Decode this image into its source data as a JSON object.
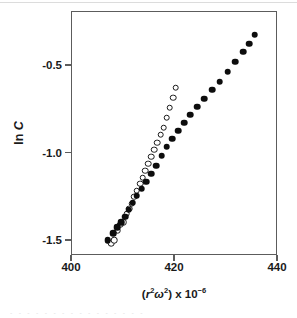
{
  "figure": {
    "caption_ghost": "- - - - - - - - - - - - - - - -"
  },
  "axes": {
    "x_ticks": [
      {
        "value": 400,
        "label": "400"
      },
      {
        "value": 420,
        "label": "420"
      },
      {
        "value": 440,
        "label": "440"
      }
    ],
    "y_ticks": [
      {
        "value": -0.5,
        "label": "-0.5"
      },
      {
        "value": -1.0,
        "label": "-1.0"
      },
      {
        "value": -1.5,
        "label": "-1.5"
      }
    ],
    "x_title_prefix": "(",
    "x_title_r": "r",
    "x_title_r_sup": "2",
    "x_title_omega": "ω",
    "x_title_omega_sup": "2",
    "x_title_mid": ") x 10",
    "x_title_exp": "−6",
    "y_title_ln": "ln ",
    "y_title_c": "C"
  },
  "chart_data": {
    "type": "scatter",
    "title": "",
    "subtitle": "",
    "xlabel": "(r²ω²) x 10⁻⁶",
    "ylabel": "ln C",
    "xlim": [
      400,
      440
    ],
    "ylim": [
      -1.6,
      -0.23
    ],
    "grid": false,
    "legend": null,
    "axis_color": "#5c5c5c",
    "marker_color": "#0d0d0d",
    "series": [
      {
        "name": "open-circles",
        "marker": "open circle",
        "points": [
          [
            407.6,
            -1.514
          ],
          [
            408.2,
            -1.494
          ],
          [
            408.9,
            -1.441
          ],
          [
            409.4,
            -1.408
          ],
          [
            410.0,
            -1.391
          ],
          [
            410.6,
            -1.345
          ],
          [
            411.1,
            -1.316
          ],
          [
            411.6,
            -1.287
          ],
          [
            412.1,
            -1.247
          ],
          [
            412.6,
            -1.213
          ],
          [
            413.2,
            -1.173
          ],
          [
            413.7,
            -1.139
          ],
          [
            414.2,
            -1.099
          ],
          [
            414.8,
            -1.059
          ],
          [
            415.4,
            -1.019
          ],
          [
            416.0,
            -0.979
          ],
          [
            416.6,
            -0.939
          ],
          [
            417.2,
            -0.893
          ],
          [
            417.8,
            -0.853
          ],
          [
            418.4,
            -0.796
          ],
          [
            419.0,
            -0.739
          ],
          [
            419.6,
            -0.682
          ],
          [
            420.1,
            -0.625
          ]
        ]
      },
      {
        "name": "filled-circles",
        "marker": "filled circle",
        "points": [
          [
            406.9,
            -1.497
          ],
          [
            408.0,
            -1.457
          ],
          [
            408.8,
            -1.42
          ],
          [
            409.6,
            -1.391
          ],
          [
            410.3,
            -1.362
          ],
          [
            411.0,
            -1.322
          ],
          [
            411.8,
            -1.282
          ],
          [
            412.6,
            -1.242
          ],
          [
            413.5,
            -1.202
          ],
          [
            414.4,
            -1.162
          ],
          [
            415.4,
            -1.116
          ],
          [
            416.4,
            -1.07
          ],
          [
            417.4,
            -1.013
          ],
          [
            418.4,
            -0.962
          ],
          [
            419.5,
            -0.916
          ],
          [
            420.6,
            -0.87
          ],
          [
            421.8,
            -0.825
          ],
          [
            423.0,
            -0.779
          ],
          [
            424.3,
            -0.733
          ],
          [
            425.7,
            -0.687
          ],
          [
            427.2,
            -0.636
          ],
          [
            428.7,
            -0.59
          ],
          [
            430.2,
            -0.533
          ],
          [
            431.7,
            -0.476
          ],
          [
            433.2,
            -0.419
          ],
          [
            434.4,
            -0.373
          ],
          [
            435.5,
            -0.322
          ]
        ]
      }
    ]
  }
}
